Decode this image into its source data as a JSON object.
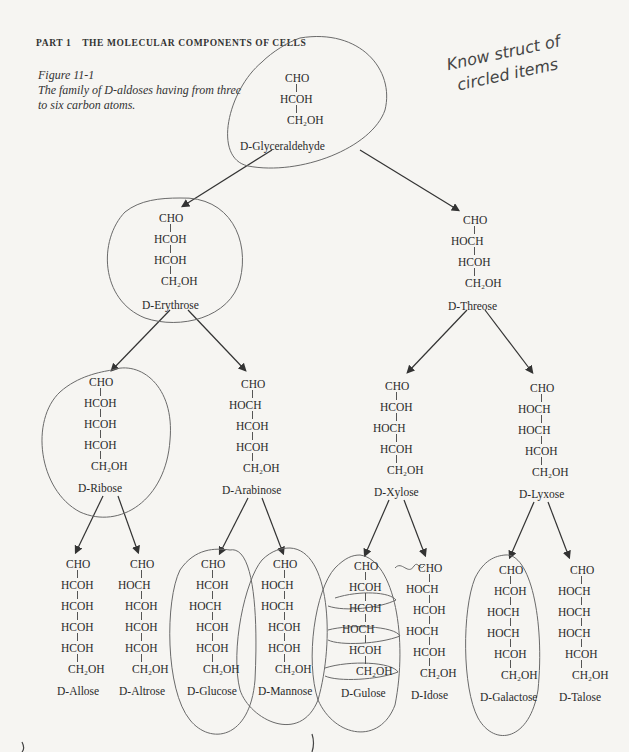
{
  "header": {
    "part": "PART 1",
    "title": "THE MOLECULAR COMPONENTS OF CELLS"
  },
  "figure": {
    "label": "Figure 11-1",
    "caption_line1": "The family of D-aldoses having from three",
    "caption_line2": "to six carbon atoms."
  },
  "handwritten_note": {
    "line1": "Know struct of",
    "line2": "circled items"
  },
  "molecules": [
    {
      "id": "glyceraldehyde",
      "name": "D-Glyceraldehyde",
      "groups": [
        "CHO",
        "HCOH",
        "CH₂OH"
      ],
      "circled": true
    },
    {
      "id": "erythrose",
      "name": "D-Erythrose",
      "groups": [
        "CHO",
        "HCOH",
        "HCOH",
        "CH₂OH"
      ],
      "circled": true
    },
    {
      "id": "threose",
      "name": "D-Threose",
      "groups": [
        "CHO",
        "HOCH",
        "HCOH",
        "CH₂OH"
      ],
      "circled": false
    },
    {
      "id": "ribose",
      "name": "D-Ribose",
      "groups": [
        "CHO",
        "HCOH",
        "HCOH",
        "HCOH",
        "CH₂OH"
      ],
      "circled": true
    },
    {
      "id": "arabinose",
      "name": "D-Arabinose",
      "groups": [
        "CHO",
        "HOCH",
        "HCOH",
        "HCOH",
        "CH₂OH"
      ],
      "circled": false
    },
    {
      "id": "xylose",
      "name": "D-Xylose",
      "groups": [
        "CHO",
        "HCOH",
        "HOCH",
        "HCOH",
        "CH₂OH"
      ],
      "circled": false
    },
    {
      "id": "lyxose",
      "name": "D-Lyxose",
      "groups": [
        "CHO",
        "HOCH",
        "HOCH",
        "HCOH",
        "CH₂OH"
      ],
      "circled": false
    },
    {
      "id": "allose",
      "name": "D-Allose",
      "groups": [
        "CHO",
        "HCOH",
        "HCOH",
        "HCOH",
        "HCOH",
        "CH₂OH"
      ],
      "circled": false
    },
    {
      "id": "altrose",
      "name": "D-Altrose",
      "groups": [
        "CHO",
        "HOCH",
        "HCOH",
        "HCOH",
        "HCOH",
        "CH₂OH"
      ],
      "circled": false
    },
    {
      "id": "glucose",
      "name": "D-Glucose",
      "groups": [
        "CHO",
        "HCOH",
        "HOCH",
        "HCOH",
        "HCOH",
        "CH₂OH"
      ],
      "circled": true
    },
    {
      "id": "mannose",
      "name": "D-Mannose",
      "groups": [
        "CHO",
        "HOCH",
        "HOCH",
        "HCOH",
        "HCOH",
        "CH₂OH"
      ],
      "circled": true
    },
    {
      "id": "gulose",
      "name": "D-Gulose",
      "groups": [
        "CHO",
        "HCOH",
        "HCOH",
        "HOCH",
        "HCOH",
        "CH₂OH"
      ],
      "circled": true,
      "scribbled": true
    },
    {
      "id": "idose",
      "name": "D-Idose",
      "groups": [
        "CHO",
        "HOCH",
        "HCOH",
        "HOCH",
        "HCOH",
        "CH₂OH"
      ],
      "circled": false
    },
    {
      "id": "galactose",
      "name": "D-Galactose",
      "groups": [
        "CHO",
        "HCOH",
        "HOCH",
        "HOCH",
        "HCOH",
        "CH₂OH"
      ],
      "circled": true
    },
    {
      "id": "talose",
      "name": "D-Talose",
      "groups": [
        "CHO",
        "HOCH",
        "HOCH",
        "HOCH",
        "HCOH",
        "CH₂OH"
      ],
      "circled": false
    }
  ],
  "colors": {
    "paper": "#f6f5f2",
    "ink": "#2a2a2a",
    "pencil": "#555555",
    "arrow": "#333333"
  }
}
